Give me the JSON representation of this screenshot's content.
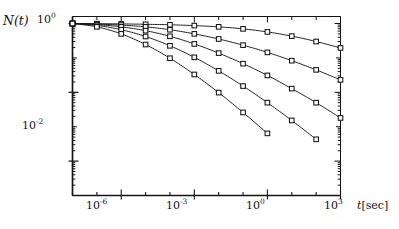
{
  "figure": {
    "background": "#ffffff",
    "ink_color": "#141414",
    "marker_style": "open-square",
    "marker_size_px": 5
  },
  "axes": {
    "y_label": "N(t)",
    "x_label_symbol": "t",
    "x_label_unit": "[sec]",
    "x_label_full": "t[sec]",
    "y_ticks_labeled": [
      {
        "exp": "0",
        "base": "10",
        "text": "10",
        "sup": "0",
        "value": 1.0
      },
      {
        "exp": "-2",
        "base": "10",
        "text": "10",
        "sup": "-2",
        "value": 0.01
      }
    ],
    "x_ticks_labeled": [
      {
        "base": "10",
        "sup": "-6",
        "value": 1e-06
      },
      {
        "base": "10",
        "sup": "-3",
        "value": 0.001
      },
      {
        "base": "10",
        "sup": "0",
        "value": 1
      },
      {
        "base": "10",
        "sup": "3",
        "value": 1000
      }
    ],
    "xscale": "log",
    "yscale": "log",
    "xlim": [
      1e-08,
      1000
    ],
    "ylim": [
      1e-05,
      1.6
    ],
    "grid": false,
    "frame": "box-with-inward-ticks"
  },
  "chart_data": {
    "type": "line",
    "title": "",
    "xlabel": "t[sec]",
    "ylabel": "N(t)",
    "xscale": "log",
    "yscale": "log",
    "xlim": [
      1e-08,
      1000
    ],
    "ylim": [
      1e-05,
      1.6
    ],
    "grid": false,
    "legend": "none",
    "marker": "open square",
    "series": [
      {
        "name": "curve-1",
        "x": [
          1e-08,
          1e-07,
          1e-06,
          1e-05,
          0.0001,
          0.001,
          0.01,
          0.1,
          1.0,
          10.0,
          100.0,
          1000.0
        ],
        "y": [
          1.0,
          0.99,
          0.975,
          0.95,
          0.92,
          0.87,
          0.8,
          0.7,
          0.57,
          0.43,
          0.3,
          0.195
        ]
      },
      {
        "name": "curve-2",
        "x": [
          1e-08,
          1e-07,
          1e-06,
          1e-05,
          0.0001,
          0.001,
          0.01,
          0.1,
          1.0,
          10.0,
          100.0,
          1000.0
        ],
        "y": [
          1.0,
          0.96,
          0.9,
          0.8,
          0.66,
          0.5,
          0.355,
          0.235,
          0.145,
          0.083,
          0.045,
          0.023
        ]
      },
      {
        "name": "curve-3",
        "x": [
          1e-08,
          1e-07,
          1e-06,
          1e-05,
          0.0001,
          0.001,
          0.01,
          0.1,
          1.0,
          10.0,
          100.0,
          1000.0
        ],
        "y": [
          1.0,
          0.93,
          0.8,
          0.62,
          0.425,
          0.255,
          0.138,
          0.068,
          0.031,
          0.0128,
          0.005,
          0.0018
        ]
      },
      {
        "name": "curve-4",
        "x": [
          1e-08,
          1e-07,
          1e-06,
          1e-05,
          0.0001,
          0.001,
          0.01,
          0.1,
          1.0,
          10.0,
          100.0
        ],
        "y": [
          1.0,
          0.88,
          0.66,
          0.42,
          0.225,
          0.104,
          0.042,
          0.0152,
          0.005,
          0.00152,
          0.00043
        ]
      },
      {
        "name": "curve-5",
        "x": [
          1e-08,
          1e-07,
          1e-06,
          1e-05,
          0.0001,
          0.001,
          0.01,
          0.1,
          1.0
        ],
        "y": [
          1.0,
          0.8,
          0.5,
          0.245,
          0.098,
          0.033,
          0.0098,
          0.0026,
          0.00064
        ]
      }
    ]
  }
}
